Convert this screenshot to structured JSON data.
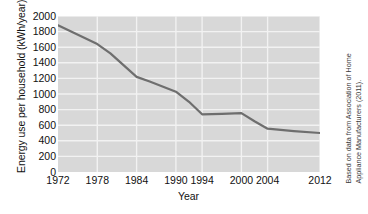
{
  "chart_data": {
    "type": "line",
    "title": "",
    "xlabel": "Year",
    "ylabel": "Energy use per household (kWh/year)",
    "x": [
      1972,
      1974,
      1978,
      1980,
      1984,
      1986,
      1990,
      1992,
      1994,
      1997,
      2000,
      2002,
      2004,
      2008,
      2012
    ],
    "values": [
      1880,
      1800,
      1640,
      1520,
      1220,
      1160,
      1030,
      900,
      740,
      745,
      755,
      650,
      555,
      525,
      500
    ],
    "series": [
      {
        "name": "Energy use per household",
        "values": [
          1880,
          1800,
          1640,
          1520,
          1220,
          1160,
          1030,
          900,
          740,
          745,
          755,
          650,
          555,
          525,
          500
        ]
      }
    ],
    "xlim": [
      1972,
      2012
    ],
    "ylim": [
      0,
      2000
    ],
    "xticks": [
      1972,
      1978,
      1984,
      1990,
      1994,
      2000,
      2004,
      2012
    ],
    "xtick_labels": [
      "1972",
      "1978",
      "1984",
      "1990",
      "1994",
      "2000",
      "2004",
      "2012"
    ],
    "yticks": [
      0,
      200,
      400,
      600,
      800,
      1000,
      1200,
      1400,
      1600,
      1800,
      2000
    ],
    "ytick_labels": [
      "0",
      "200",
      "400",
      "600",
      "800",
      "1000",
      "1200",
      "1400",
      "1600",
      "1800",
      "2000"
    ],
    "grid": true,
    "grid_color": "#f2f2f2",
    "plot_background": "#d8d8d8",
    "line_color": "#6e6e6e",
    "line_width": 2.2,
    "legend": null,
    "legend_position": "none",
    "annotations": [
      {
        "name": "source-note",
        "text_lines": [
          "Based on data from Association of Home",
          "Appliance Manufacturers (2011)."
        ],
        "position": "right-rotated"
      }
    ]
  }
}
